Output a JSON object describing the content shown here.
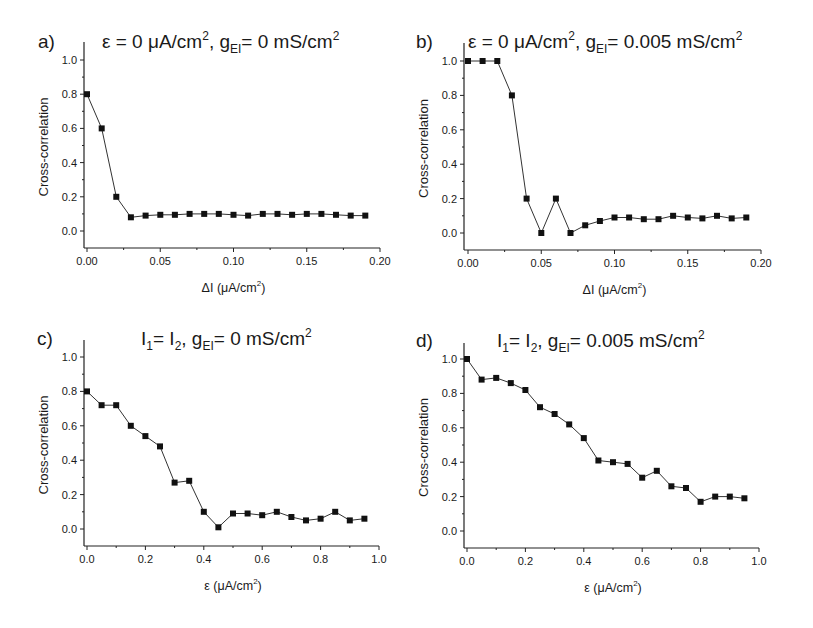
{
  "figure": {
    "panels": [
      {
        "letter": "a)",
        "title_parts": [
          "ε = 0 μA/cm",
          "2",
          ", g",
          "EI",
          "= 0 mS/cm",
          "2"
        ]
      },
      {
        "letter": "b)",
        "title_parts": [
          "ε = 0 μA/cm",
          "2",
          ", g",
          "EI",
          "= 0.005 mS/cm",
          "2"
        ]
      },
      {
        "letter": "c)",
        "title_parts": [
          "I",
          "1",
          "= I",
          "2",
          ", g",
          "EI",
          "= 0 mS/cm",
          "2"
        ]
      },
      {
        "letter": "d)",
        "title_parts": [
          "I",
          "1",
          "= I",
          "2",
          ", g",
          "EI",
          "= 0.005 mS/cm",
          "2"
        ]
      }
    ]
  },
  "chart_data": [
    {
      "type": "line",
      "panel": "a)",
      "title": "ε = 0 μA/cm², g_EI = 0 mS/cm²",
      "xlabel": "ΔI (μA/cm²)",
      "xlabel_parts": [
        "ΔI (μA/cm",
        "2",
        ")"
      ],
      "ylabel": "Cross-correlation",
      "xlim": [
        0,
        0.2
      ],
      "ylim": [
        -0.1,
        1.1
      ],
      "xticks": [
        0.0,
        0.05,
        0.1,
        0.15,
        0.2
      ],
      "xtick_labels": [
        "0.00",
        "0.05",
        "0.10",
        "0.15",
        "0.20"
      ],
      "xminor": [
        0.025,
        0.075,
        0.125,
        0.175
      ],
      "yticks": [
        0.0,
        0.2,
        0.4,
        0.6,
        0.8,
        1.0
      ],
      "ytick_labels": [
        "0.0",
        "0.2",
        "0.4",
        "0.6",
        "0.8",
        "1.0"
      ],
      "grid": false,
      "marker": "square",
      "series": [
        {
          "name": "cross-correlation",
          "x": [
            0.0,
            0.01,
            0.02,
            0.03,
            0.04,
            0.05,
            0.06,
            0.07,
            0.08,
            0.09,
            0.1,
            0.11,
            0.12,
            0.13,
            0.14,
            0.15,
            0.16,
            0.17,
            0.18,
            0.19
          ],
          "y": [
            0.8,
            0.6,
            0.2,
            0.08,
            0.09,
            0.095,
            0.095,
            0.1,
            0.1,
            0.1,
            0.095,
            0.09,
            0.1,
            0.1,
            0.095,
            0.1,
            0.1,
            0.095,
            0.09,
            0.09
          ]
        }
      ]
    },
    {
      "type": "line",
      "panel": "b)",
      "title": "ε = 0 μA/cm², g_EI = 0.005 mS/cm²",
      "xlabel": "ΔI (μA/cm²)",
      "xlabel_parts": [
        "ΔI (μA/cm",
        "2",
        ")"
      ],
      "ylabel": "Cross-correlation",
      "xlim": [
        0,
        0.2
      ],
      "ylim": [
        -0.1,
        1.1
      ],
      "xticks": [
        0.0,
        0.05,
        0.1,
        0.15,
        0.2
      ],
      "xtick_labels": [
        "0.00",
        "0.05",
        "0.10",
        "0.15",
        "0.20"
      ],
      "xminor": [
        0.025,
        0.075,
        0.125,
        0.175
      ],
      "yticks": [
        0.0,
        0.2,
        0.4,
        0.6,
        0.8,
        1.0
      ],
      "ytick_labels": [
        "0.0",
        "0.2",
        "0.4",
        "0.6",
        "0.8",
        "1.0"
      ],
      "grid": false,
      "marker": "square",
      "series": [
        {
          "name": "cross-correlation",
          "x": [
            0.0,
            0.01,
            0.02,
            0.03,
            0.04,
            0.05,
            0.06,
            0.07,
            0.08,
            0.09,
            0.1,
            0.11,
            0.12,
            0.13,
            0.14,
            0.15,
            0.16,
            0.17,
            0.18,
            0.19
          ],
          "y": [
            1.0,
            1.0,
            1.0,
            0.8,
            0.2,
            0.0,
            0.2,
            0.0,
            0.045,
            0.07,
            0.09,
            0.09,
            0.08,
            0.08,
            0.1,
            0.09,
            0.085,
            0.1,
            0.085,
            0.09
          ]
        }
      ]
    },
    {
      "type": "line",
      "panel": "c)",
      "title": "I₁ = I₂, g_EI = 0 mS/cm²",
      "xlabel": "ε (μA/cm²)",
      "xlabel_parts": [
        "ε (μA/cm",
        "2",
        ")"
      ],
      "ylabel": "Cross-correlation",
      "xlim": [
        0,
        1.0
      ],
      "ylim": [
        -0.1,
        1.1
      ],
      "xticks": [
        0.0,
        0.2,
        0.4,
        0.6,
        0.8,
        1.0
      ],
      "xtick_labels": [
        "0.0",
        "0.2",
        "0.4",
        "0.6",
        "0.8",
        "1.0"
      ],
      "xminor": [
        0.1,
        0.3,
        0.5,
        0.7,
        0.9
      ],
      "yticks": [
        0.0,
        0.2,
        0.4,
        0.6,
        0.8,
        1.0
      ],
      "ytick_labels": [
        "0.0",
        "0.2",
        "0.4",
        "0.6",
        "0.8",
        "1.0"
      ],
      "grid": false,
      "marker": "square",
      "series": [
        {
          "name": "cross-correlation",
          "x": [
            0.0,
            0.05,
            0.1,
            0.15,
            0.2,
            0.25,
            0.3,
            0.35,
            0.4,
            0.45,
            0.5,
            0.55,
            0.6,
            0.65,
            0.7,
            0.75,
            0.8,
            0.85,
            0.9,
            0.95
          ],
          "y": [
            0.8,
            0.72,
            0.72,
            0.6,
            0.54,
            0.48,
            0.27,
            0.28,
            0.1,
            0.01,
            0.09,
            0.09,
            0.08,
            0.1,
            0.07,
            0.05,
            0.06,
            0.1,
            0.05,
            0.06
          ]
        }
      ]
    },
    {
      "type": "line",
      "panel": "d)",
      "title": "I₁ = I₂, g_EI = 0.005 mS/cm²",
      "xlabel": "ε (μA/cm²)",
      "xlabel_parts": [
        "ε (μA/cm",
        "2",
        ")"
      ],
      "ylabel": "Cross-correlation",
      "xlim": [
        0,
        1.0
      ],
      "ylim": [
        -0.1,
        1.1
      ],
      "xticks": [
        0.0,
        0.2,
        0.4,
        0.6,
        0.8,
        1.0
      ],
      "xtick_labels": [
        "0.0",
        "0.2",
        "0.4",
        "0.6",
        "0.8",
        "1.0"
      ],
      "xminor": [
        0.1,
        0.3,
        0.5,
        0.7,
        0.9
      ],
      "yticks": [
        0.0,
        0.2,
        0.4,
        0.6,
        0.8,
        1.0
      ],
      "ytick_labels": [
        "0.0",
        "0.2",
        "0.4",
        "0.6",
        "0.8",
        "1.0"
      ],
      "grid": false,
      "marker": "square",
      "series": [
        {
          "name": "cross-correlation",
          "x": [
            0.0,
            0.05,
            0.1,
            0.15,
            0.2,
            0.25,
            0.3,
            0.35,
            0.4,
            0.45,
            0.5,
            0.55,
            0.6,
            0.65,
            0.7,
            0.75,
            0.8,
            0.85,
            0.9,
            0.95
          ],
          "y": [
            1.0,
            0.88,
            0.89,
            0.86,
            0.82,
            0.72,
            0.68,
            0.62,
            0.54,
            0.41,
            0.4,
            0.39,
            0.31,
            0.35,
            0.26,
            0.25,
            0.17,
            0.2,
            0.2,
            0.19
          ]
        }
      ]
    }
  ]
}
